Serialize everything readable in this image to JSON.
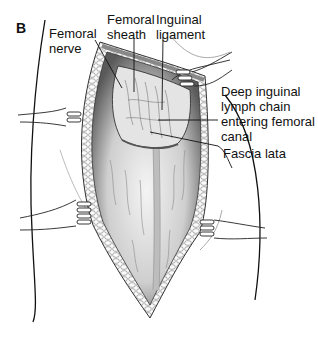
{
  "figure": {
    "panel_label": "B",
    "labels": [
      {
        "id": "femoral-nerve",
        "text": "Femoral\nnerve"
      },
      {
        "id": "femoral-sheath",
        "text": "Femoral\nsheath"
      },
      {
        "id": "inguinal-ligament",
        "text": "Inguinal\nligament"
      },
      {
        "id": "deep-inguinal-lymph-chain",
        "text": "Deep inguinal\nlymph chain\nentering femoral\ncanal"
      },
      {
        "id": "fascia-lata",
        "text": "Fascia lata"
      }
    ]
  }
}
